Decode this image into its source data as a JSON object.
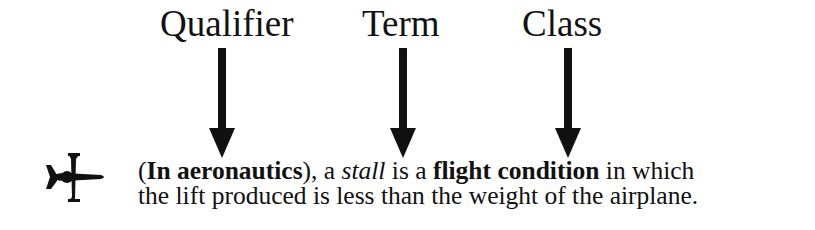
{
  "labels": {
    "qualifier": "Qualifier",
    "term": "Term",
    "class": "Class"
  },
  "icon": "airplane-icon",
  "definition": {
    "open_paren": "(",
    "qualifier_text": "In aeronautics",
    "after_qualifier": "), a ",
    "term_text": "stall",
    "after_term": " is a ",
    "class_text": "flight condition",
    "after_class": " in which",
    "line2": "the lift produced is less than the weight of the airplane."
  }
}
